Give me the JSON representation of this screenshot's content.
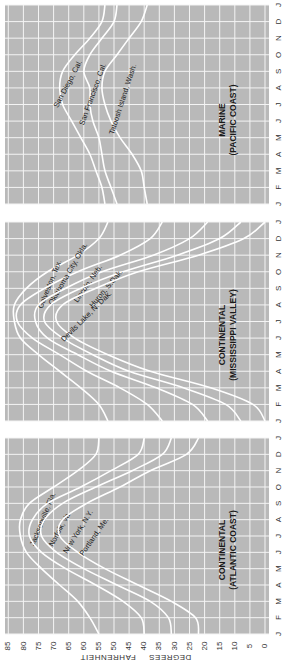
{
  "chart_data": {
    "type": "line",
    "orientation": "rotated-90-clockwise (temperature axis horizontal at bottom, months vertical)",
    "xlabel": "DEGREES FAHRENHEIT",
    "temperature_ticks": [
      85,
      80,
      75,
      70,
      65,
      60,
      55,
      50,
      45,
      40,
      35,
      30,
      25,
      20,
      15,
      10,
      5,
      0
    ],
    "month_ticks": [
      "J",
      "F",
      "M",
      "A",
      "M",
      "J",
      "J",
      "A",
      "S",
      "O",
      "N",
      "D",
      "J"
    ],
    "temp_range": [
      0,
      85
    ],
    "grid": true,
    "panels": [
      {
        "title": "MARINE",
        "subtitle": "(PACIFIC COAST)",
        "series": [
          {
            "name": "San Diego, Cal.",
            "values": [
              53,
              54,
              56,
              58,
              61,
              64,
              67,
              68,
              67,
              63,
              58,
              54,
              53
            ]
          },
          {
            "name": "San Francisco, Cal.",
            "values": [
              49,
              51,
              53,
              54,
              55,
              57,
              58,
              58,
              60,
              58,
              54,
              50,
              49
            ]
          },
          {
            "name": "Tatoosh Island, Wash.",
            "values": [
              39,
              40,
              41,
              44,
              48,
              51,
              53,
              54,
              53,
              49,
              45,
              41,
              39
            ]
          }
        ]
      },
      {
        "title": "CONTINENTAL",
        "subtitle": "(MISSISSIPPI VALLEY)",
        "series": [
          {
            "name": "Galveston, Tex.",
            "values": [
              52,
              55,
              61,
              68,
              75,
              81,
              83,
              83,
              79,
              72,
              62,
              55,
              52
            ]
          },
          {
            "name": "Oklahoma City, Okla.",
            "values": [
              34,
              39,
              48,
              59,
              68,
              77,
              82,
              81,
              73,
              62,
              48,
              38,
              34
            ]
          },
          {
            "name": "Lincoln, Neb.",
            "values": [
              19,
              24,
              36,
              51,
              62,
              72,
              76,
              75,
              66,
              54,
              37,
              25,
              19
            ]
          },
          {
            "name": "Huron, S.Dak.",
            "values": [
              8,
              13,
              27,
              45,
              57,
              67,
              73,
              71,
              61,
              47,
              29,
              15,
              8
            ]
          },
          {
            "name": "Devils Lake, N. Dak.",
            "values": [
              0,
              4,
              18,
              38,
              52,
              63,
              69,
              67,
              56,
              42,
              22,
              7,
              0
            ]
          }
        ]
      },
      {
        "title": "CONTINENTAL",
        "subtitle": "(ATLANTIC COAST)",
        "series": [
          {
            "name": "Jacksonville, Fla.",
            "values": [
              55,
              58,
              62,
              68,
              74,
              79,
              81,
              81,
              78,
              70,
              62,
              56,
              55
            ]
          },
          {
            "name": "Norfolk, Va.",
            "values": [
              40,
              41,
              47,
              56,
              66,
              74,
              78,
              77,
              72,
              61,
              51,
              42,
              40
            ]
          },
          {
            "name": "New York, N.Y.",
            "values": [
              31,
              32,
              38,
              49,
              60,
              69,
              74,
              73,
              67,
              56,
              44,
              34,
              31
            ]
          },
          {
            "name": "Portland, Me.",
            "values": [
              22,
              23,
              31,
              42,
              53,
              62,
              68,
              67,
              59,
              48,
              38,
              26,
              22
            ]
          }
        ]
      }
    ]
  }
}
